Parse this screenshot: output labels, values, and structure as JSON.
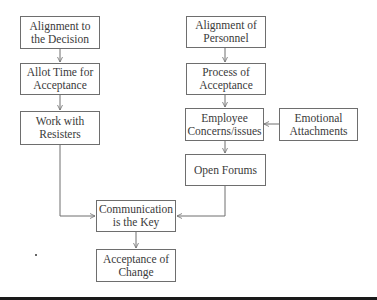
{
  "diagram": {
    "type": "flowchart",
    "nodes": [
      {
        "id": "align_decision",
        "label": "Alignment to the Decision"
      },
      {
        "id": "allot_time",
        "label": "Allot Time for Acceptance"
      },
      {
        "id": "work_resisters",
        "label": "Work with Resisters"
      },
      {
        "id": "align_personnel",
        "label": "Alignment of Personnel"
      },
      {
        "id": "process_acceptance",
        "label": "Process of Acceptance"
      },
      {
        "id": "employee_concerns",
        "label": "Employee Concerns/issues"
      },
      {
        "id": "emotional_attachments",
        "label": "Emotional Attachments"
      },
      {
        "id": "open_forums",
        "label": "Open Forums"
      },
      {
        "id": "communication",
        "label": "Communication is the Key"
      },
      {
        "id": "acceptance_change",
        "label": "Acceptance of Change"
      }
    ],
    "edges": [
      {
        "from": "align_decision",
        "to": "allot_time"
      },
      {
        "from": "allot_time",
        "to": "work_resisters"
      },
      {
        "from": "work_resisters",
        "to": "communication"
      },
      {
        "from": "align_personnel",
        "to": "process_acceptance"
      },
      {
        "from": "process_acceptance",
        "to": "employee_concerns"
      },
      {
        "from": "emotional_attachments",
        "to": "employee_concerns"
      },
      {
        "from": "employee_concerns",
        "to": "open_forums"
      },
      {
        "from": "open_forums",
        "to": "communication"
      },
      {
        "from": "communication",
        "to": "acceptance_change"
      }
    ],
    "colors": {
      "border": "#6e6e6e",
      "text": "#3a3a3a",
      "line": "#6e6e6e",
      "background": "#ffffff"
    }
  }
}
